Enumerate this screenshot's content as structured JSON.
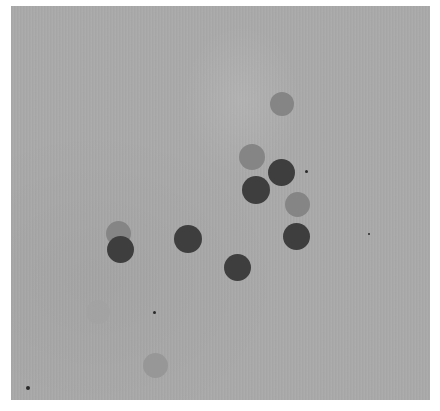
{
  "image": {
    "description": "Grayscale photograph of circular spots on a gray paper background",
    "colors": {
      "background": "#aaaaaa",
      "dark": "#3e3e3e",
      "medium": "#858585",
      "light": "#979797",
      "faint": "#a2a2a2"
    },
    "spots": [
      {
        "tone": "medium",
        "label": "spot-top-right"
      },
      {
        "tone": "medium",
        "label": "spot-upper-cluster-1"
      },
      {
        "tone": "dark",
        "label": "spot-upper-cluster-2"
      },
      {
        "tone": "dark",
        "label": "spot-upper-cluster-3"
      },
      {
        "tone": "medium",
        "label": "spot-right-medium"
      },
      {
        "tone": "dark",
        "label": "spot-right-dark"
      },
      {
        "tone": "medium",
        "label": "spot-left-back"
      },
      {
        "tone": "dark",
        "label": "spot-left-front"
      },
      {
        "tone": "dark",
        "label": "spot-center"
      },
      {
        "tone": "dark",
        "label": "spot-lower-center"
      },
      {
        "tone": "faint",
        "label": "spot-faint-lower-left"
      },
      {
        "tone": "light",
        "label": "spot-bottom"
      }
    ]
  }
}
